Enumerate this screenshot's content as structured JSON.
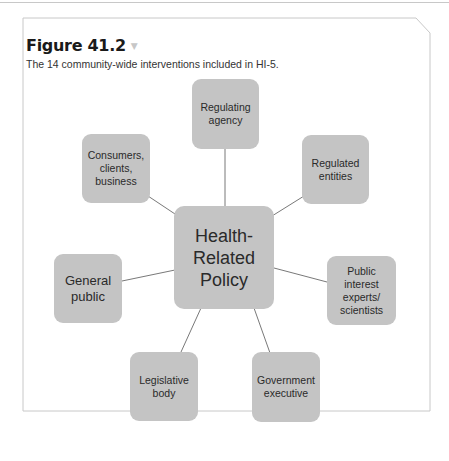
{
  "figure": {
    "title": "Figure 41.2",
    "caption": "The 14 community-wide interventions included in HI-5."
  },
  "diagram": {
    "center": {
      "label_lines": [
        "Health-",
        "Related",
        "Policy"
      ]
    },
    "nodes": [
      {
        "id": "regulating-agency",
        "label_lines": [
          "Regulating",
          "agency"
        ]
      },
      {
        "id": "regulated-entities",
        "label_lines": [
          "Regulated",
          "entities"
        ]
      },
      {
        "id": "public-interest",
        "label_lines": [
          "Public",
          "interest",
          "experts/",
          "scientists"
        ]
      },
      {
        "id": "government-executive",
        "label_lines": [
          "Government",
          "executive"
        ]
      },
      {
        "id": "legislative-body",
        "label_lines": [
          "Legislative",
          "body"
        ]
      },
      {
        "id": "general-public",
        "label_lines": [
          "General",
          "public"
        ]
      },
      {
        "id": "consumers",
        "label_lines": [
          "Consumers,",
          "clients,",
          "business"
        ]
      }
    ],
    "colors": {
      "node_fill": "#c4c4c4",
      "connector": "#555555",
      "frame": "#c8c8c8"
    }
  }
}
